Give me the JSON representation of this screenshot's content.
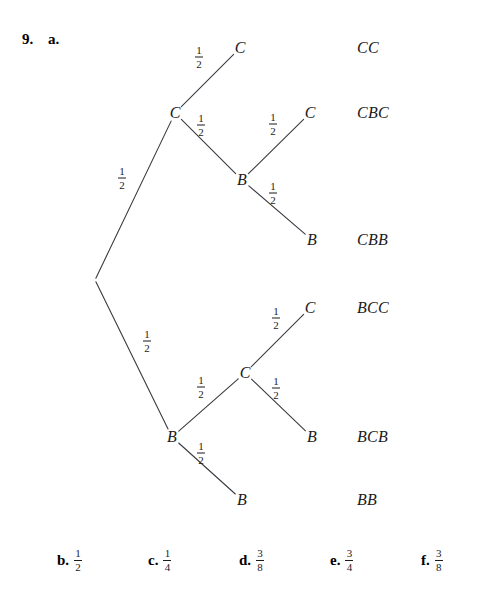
{
  "problem": {
    "number": "9.",
    "part_a": "a."
  },
  "tree": {
    "nodes": [
      {
        "id": "root",
        "label": "",
        "x": 95,
        "y": 280
      },
      {
        "id": "c1",
        "label": "C",
        "x": 175,
        "y": 113
      },
      {
        "id": "b1",
        "label": "B",
        "x": 172,
        "y": 437
      },
      {
        "id": "c1_c",
        "label": "C",
        "x": 240,
        "y": 48
      },
      {
        "id": "c1_b",
        "label": "B",
        "x": 242,
        "y": 180
      },
      {
        "id": "c1_b_c",
        "label": "C",
        "x": 310,
        "y": 113
      },
      {
        "id": "c1_b_b",
        "label": "B",
        "x": 312,
        "y": 240
      },
      {
        "id": "b1_c",
        "label": "C",
        "x": 245,
        "y": 373
      },
      {
        "id": "b1_b",
        "label": "B",
        "x": 242,
        "y": 500
      },
      {
        "id": "b1_c_c",
        "label": "C",
        "x": 310,
        "y": 308
      },
      {
        "id": "b1_c_b",
        "label": "B",
        "x": 312,
        "y": 437
      }
    ],
    "edges": [
      {
        "id": "e-root-c1",
        "from": "root",
        "to": "c1",
        "prob_num": "1",
        "prob_den": "2",
        "label_x": 122,
        "label_y": 178
      },
      {
        "id": "e-root-b1",
        "from": "root",
        "to": "b1",
        "prob_num": "1",
        "prob_den": "2",
        "label_x": 147,
        "label_y": 341
      },
      {
        "id": "e-c1-c",
        "from": "c1",
        "to": "c1_c",
        "prob_num": "1",
        "prob_den": "2",
        "label_x": 199,
        "label_y": 57
      },
      {
        "id": "e-c1-b",
        "from": "c1",
        "to": "c1_b",
        "prob_num": "1",
        "prob_den": "2",
        "label_x": 201,
        "label_y": 125
      },
      {
        "id": "e-c1b-c",
        "from": "c1_b",
        "to": "c1_b_c",
        "prob_num": "1",
        "prob_den": "2",
        "label_x": 273,
        "label_y": 124
      },
      {
        "id": "e-c1b-b",
        "from": "c1_b",
        "to": "c1_b_b",
        "prob_num": "1",
        "prob_den": "2",
        "label_x": 273,
        "label_y": 193
      },
      {
        "id": "e-b1-c",
        "from": "b1",
        "to": "b1_c",
        "prob_num": "1",
        "prob_den": "2",
        "label_x": 201,
        "label_y": 387
      },
      {
        "id": "e-b1-b",
        "from": "b1",
        "to": "b1_b",
        "prob_num": "1",
        "prob_den": "2",
        "label_x": 201,
        "label_y": 453
      },
      {
        "id": "e-b1c-c",
        "from": "b1_c",
        "to": "b1_c_c",
        "prob_num": "1",
        "prob_den": "2",
        "label_x": 276,
        "label_y": 318
      },
      {
        "id": "e-b1c-b",
        "from": "b1_c",
        "to": "b1_c_b",
        "prob_num": "1",
        "prob_den": "2",
        "label_x": 276,
        "label_y": 388
      }
    ],
    "outcomes": [
      {
        "id": "outcome-cc",
        "text": "CC",
        "x": 357,
        "y": 48
      },
      {
        "id": "outcome-cbc",
        "text": "CBC",
        "x": 357,
        "y": 113
      },
      {
        "id": "outcome-cbb",
        "text": "CBB",
        "x": 357,
        "y": 240
      },
      {
        "id": "outcome-bcc",
        "text": "BCC",
        "x": 357,
        "y": 308
      },
      {
        "id": "outcome-bcb",
        "text": "BCB",
        "x": 357,
        "y": 437
      },
      {
        "id": "outcome-bb",
        "text": "BB",
        "x": 357,
        "y": 500
      }
    ]
  },
  "answers": [
    {
      "id": "answer-b",
      "letter": "b.",
      "num": "1",
      "den": "2",
      "x": 57
    },
    {
      "id": "answer-c",
      "letter": "c.",
      "num": "1",
      "den": "4",
      "x": 148
    },
    {
      "id": "answer-d",
      "letter": "d.",
      "num": "3",
      "den": "8",
      "x": 239
    },
    {
      "id": "answer-e",
      "letter": "e.",
      "num": "3",
      "den": "4",
      "x": 330
    },
    {
      "id": "answer-f",
      "letter": "f.",
      "num": "3",
      "den": "8",
      "x": 421
    }
  ],
  "colors": {
    "ink": "#1b1b1b",
    "bold_ink": "#000000",
    "background": "#ffffff"
  }
}
